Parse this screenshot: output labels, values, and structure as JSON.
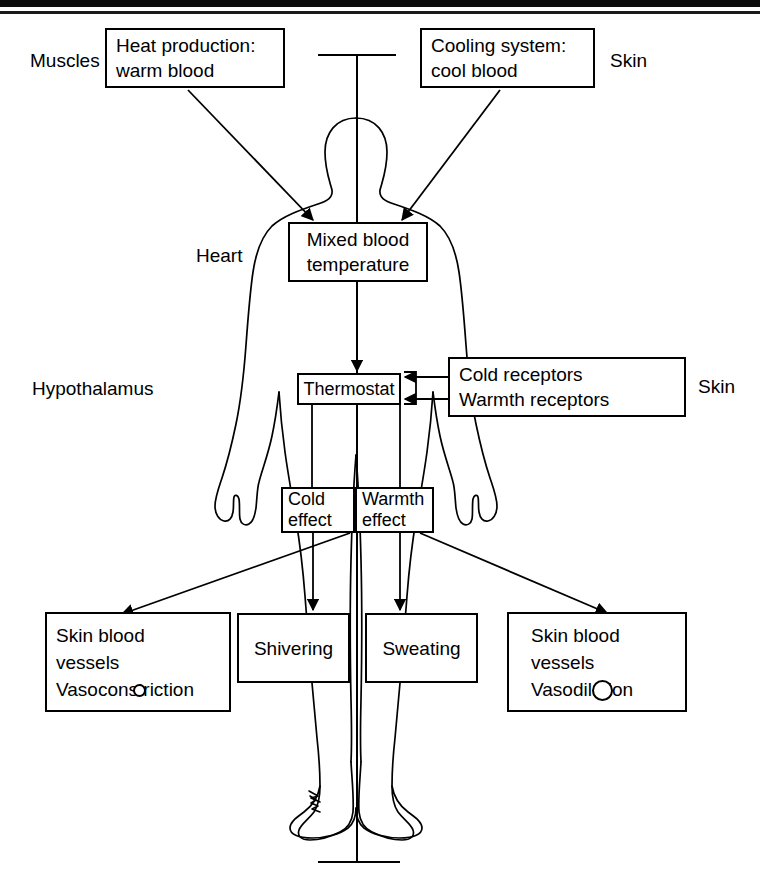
{
  "figure": {
    "line_color": "#000000",
    "background_color": "#ffffff"
  },
  "labels": {
    "muscles": "Muscles",
    "skin_top": "Skin",
    "heart": "Heart",
    "hypothalamus": "Hypothalamus",
    "skin_right": "Skin"
  },
  "boxes": {
    "heat_production": "Heat production:\nwarm blood",
    "cooling_system": "Cooling system:\ncool blood",
    "mixed_blood": "Mixed blood\ntemperature",
    "thermostat": "Thermostat",
    "receptors": "Cold receptors\nWarmth receptors",
    "cold_effect": "Cold\neffect",
    "warmth_effect": "Warmth\neffect",
    "vasoconstriction": "Skin blood\nvessels\nVasoconstriction",
    "shivering": "Shivering",
    "sweating": "Sweating",
    "vasodilation": "Skin blood\nvessels\nVasodilation"
  },
  "receptor_lines": {
    "cold": "Cold receptors",
    "warmth": "Warmth receptors"
  },
  "flow": {
    "heat_production_to_mixed_blood": "arrow",
    "cooling_system_to_mixed_blood": "arrow",
    "mixed_blood_to_thermostat": "arrow",
    "cold_receptors_to_thermostat": "arrow",
    "warmth_receptors_to_thermostat": "arrow",
    "thermostat_to_cold_effect": "line",
    "thermostat_to_warmth_effect": "line",
    "cold_effect_to_vasoconstriction": "arrow",
    "cold_effect_to_shivering": "arrow",
    "warmth_effect_to_sweating": "arrow",
    "warmth_effect_to_vasodilation": "arrow"
  },
  "symbols": {
    "vasoconstriction_vessel": "small-circle",
    "vasodilation_vessel": "large-circle"
  }
}
